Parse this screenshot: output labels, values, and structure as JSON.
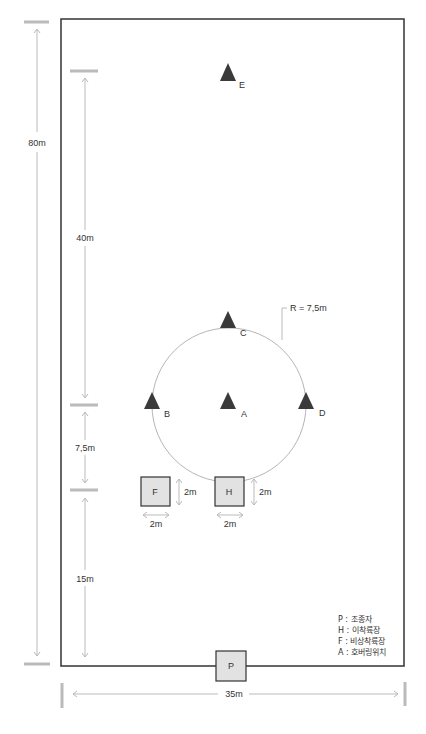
{
  "diagram": {
    "field": {
      "width_label": "35m",
      "height_label": "80m"
    },
    "markers": [
      {
        "id": "E",
        "label": "E"
      },
      {
        "id": "C",
        "label": "C"
      },
      {
        "id": "B",
        "label": "B"
      },
      {
        "id": "A",
        "label": "A"
      },
      {
        "id": "D",
        "label": "D"
      }
    ],
    "circle": {
      "radius_label": "R = 7,5m"
    },
    "pads": [
      {
        "id": "F",
        "label": "F",
        "width_label": "2m",
        "height_label": "2m"
      },
      {
        "id": "H",
        "label": "H",
        "width_label": "2m",
        "height_label": "2m"
      },
      {
        "id": "P",
        "label": "P"
      }
    ],
    "dimensions": {
      "top_segment": "40m",
      "middle_segment": "7,5m",
      "bottom_segment": "15m",
      "total_height": "80m",
      "total_width": "35m"
    },
    "legend": [
      "P : 조종자",
      "H : 이착륙장",
      "F : 비상착륙장",
      "A : 호버링위치"
    ],
    "colors": {
      "field_border": "#333333",
      "marker_fill": "#3a3a3a",
      "pad_fill": "#e2e2e2",
      "dimension_line": "#bbbbbb",
      "circle": "#b5b5b5"
    }
  }
}
